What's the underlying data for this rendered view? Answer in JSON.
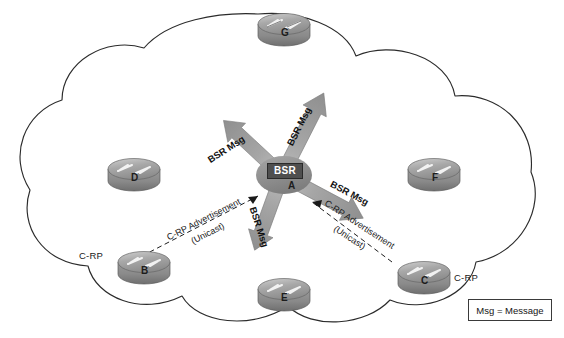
{
  "diagram": {
    "background_color": "#ffffff",
    "cloud": {
      "name": "network-cloud",
      "stroke_color": "#2b2b2b",
      "fill_color": "#ffffff"
    },
    "center_node": {
      "tag_label": "BSR",
      "letter": "A",
      "tag_bg": "#4f4f4f",
      "tag_fg": "#ffffff"
    },
    "routers": [
      {
        "id": "G",
        "letter": "G",
        "side_label": "",
        "x": 258,
        "y": 10
      },
      {
        "id": "D",
        "letter": "D",
        "side_label": "",
        "x": 108,
        "y": 155
      },
      {
        "id": "F",
        "letter": "F",
        "side_label": "",
        "x": 408,
        "y": 155
      },
      {
        "id": "B",
        "letter": "B",
        "side_label": "C-RP",
        "x": 118,
        "y": 248
      },
      {
        "id": "E",
        "letter": "E",
        "side_label": "",
        "x": 258,
        "y": 275
      },
      {
        "id": "C",
        "letter": "C",
        "side_label": "C-RP",
        "x": 398,
        "y": 258
      }
    ],
    "router_side_labels": [
      {
        "text": "C-RP",
        "for": "B",
        "x": 79,
        "y": 250
      },
      {
        "text": "C-RP",
        "for": "C",
        "x": 437,
        "y": 277
      }
    ],
    "bsr_arrows": [
      {
        "name": "bsr-msg-arrow-upper-left",
        "label": "BSR Msg",
        "direction": "up-left"
      },
      {
        "name": "bsr-msg-arrow-upper-right",
        "label": "BSR Msg",
        "direction": "up-right"
      },
      {
        "name": "bsr-msg-arrow-lower-left",
        "label": "BSR Msg",
        "direction": "down-left"
      },
      {
        "name": "bsr-msg-arrow-lower-right",
        "label": "BSR Msg",
        "direction": "down-right"
      }
    ],
    "crp_advertisements": [
      {
        "name": "crp-advertisement-from-b",
        "line1": "C-RP Advertisement",
        "line2": "(Unicast)",
        "from": "B",
        "to": "A",
        "style": "dashed"
      },
      {
        "name": "crp-advertisement-from-c",
        "line1": "C-RP Advertisement",
        "line2": "(Unicast)",
        "from": "C",
        "to": "A",
        "style": "dashed"
      }
    ],
    "legend": {
      "text": "Msg = Message"
    }
  }
}
